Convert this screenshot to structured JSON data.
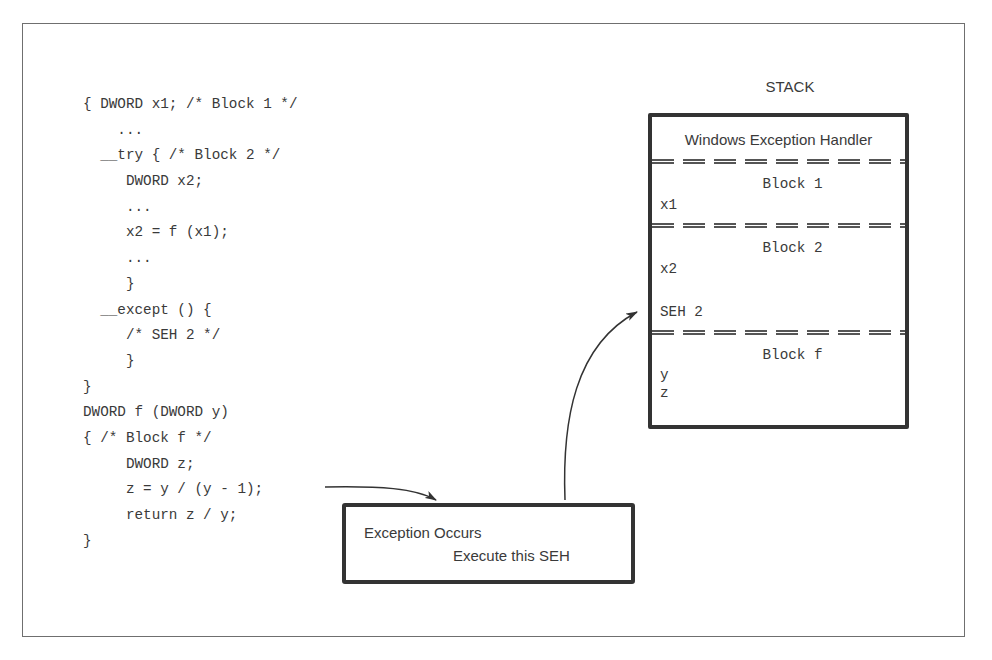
{
  "code": {
    "lines": [
      "{ DWORD x1; /* Block 1 */",
      "    ...",
      "  __try { /* Block 2 */",
      "     DWORD x2;",
      "     ...",
      "     x2 = f (x1);",
      "     ...",
      "     }",
      "  __except () {",
      "     /* SEH 2 */",
      "     }",
      "}",
      "DWORD f (DWORD y)",
      "{ /* Block f */",
      "     DWORD z;",
      "     z = y / (y - 1);",
      "     return z / y;",
      "}"
    ]
  },
  "stack": {
    "title": "STACK",
    "handler_label": "Windows Exception Handler",
    "blocks": [
      {
        "title": "Block 1",
        "vars": [
          "x1"
        ]
      },
      {
        "title": "Block 2",
        "vars": [
          "x2",
          "SEH 2"
        ]
      },
      {
        "title": "Block f",
        "vars": [
          "y",
          "z"
        ]
      }
    ]
  },
  "exception_box": {
    "line1": "Exception Occurs",
    "line2": "Execute this SEH"
  },
  "colors": {
    "ink": "#333333",
    "text": "#3a3a3a",
    "frame": "#6f6f6f",
    "background": "#ffffff"
  }
}
